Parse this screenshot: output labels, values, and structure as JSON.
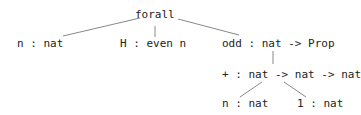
{
  "tree": {
    "root": {
      "label": "forall"
    },
    "level1": [
      {
        "label": "n : nat"
      },
      {
        "label": "H : even n"
      },
      {
        "label": "odd : nat -> Prop"
      }
    ],
    "level2": [
      {
        "label": "+ : nat -> nat -> nat"
      }
    ],
    "level3": [
      {
        "label": "n : nat"
      },
      {
        "label": "1 : nat"
      }
    ],
    "colors": {
      "text": "#222222",
      "edge": "#888888",
      "background": "#ffffff"
    }
  }
}
